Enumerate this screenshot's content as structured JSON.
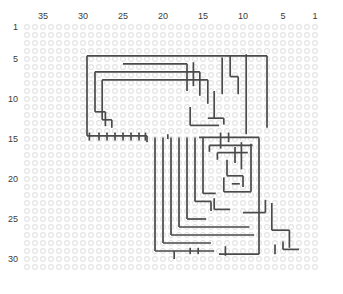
{
  "chart_data": {
    "type": "grid-pattern",
    "title": "",
    "xlabel": "",
    "ylabel": "",
    "grid": {
      "columns": 37,
      "rows": 31,
      "cell_size": 8,
      "origin_x": 27,
      "origin_y": 27,
      "direction_x": "right-to-left",
      "direction_y": "top-to-bottom",
      "dot_radius": 2.4,
      "dot_color": "#e2e2e2",
      "background": "#ffffff"
    },
    "axes": {
      "column_labels": [
        {
          "value": "35",
          "col": 35
        },
        {
          "value": "30",
          "col": 30
        },
        {
          "value": "25",
          "col": 25
        },
        {
          "value": "20",
          "col": 20
        },
        {
          "value": "15",
          "col": 15
        },
        {
          "value": "10",
          "col": 10
        },
        {
          "value": "5",
          "col": 5
        },
        {
          "value": "1",
          "col": 1
        }
      ],
      "row_labels": [
        {
          "value": "1",
          "row": 1
        },
        {
          "value": "5",
          "row": 5
        },
        {
          "value": "10",
          "row": 10
        },
        {
          "value": "15",
          "row": 15
        },
        {
          "value": "20",
          "row": 20
        },
        {
          "value": "25",
          "row": 25
        },
        {
          "value": "30",
          "row": 30
        }
      ]
    },
    "path_color": "#4a4a4a",
    "path_width": 1.7,
    "segments": [
      {
        "type": "h",
        "row": 4.6,
        "c1": 29.5,
        "c2": 7.0
      },
      {
        "type": "v",
        "col": 29.5,
        "r1": 4.6,
        "r2": 14.6
      },
      {
        "type": "h",
        "row": 14.6,
        "c1": 29.5,
        "c2": 22.0
      },
      {
        "type": "v",
        "col": 7.0,
        "r1": 4.6,
        "r2": 13.6
      },
      {
        "type": "h",
        "row": 5.6,
        "c1": 25.0,
        "c2": 17.0
      },
      {
        "type": "h",
        "row": 6.6,
        "c1": 28.5,
        "c2": 15.4
      },
      {
        "type": "v",
        "col": 28.5,
        "r1": 6.6,
        "r2": 11.6
      },
      {
        "type": "h",
        "row": 11.6,
        "c1": 28.5,
        "c2": 27.2
      },
      {
        "type": "v",
        "col": 27.2,
        "r1": 11.6,
        "r2": 13.4
      },
      {
        "type": "h",
        "row": 7.6,
        "c1": 27.6,
        "c2": 14.4
      },
      {
        "type": "v",
        "col": 27.6,
        "r1": 7.6,
        "r2": 12.6
      },
      {
        "type": "h",
        "row": 12.6,
        "c1": 27.6,
        "c2": 26.4
      },
      {
        "type": "v",
        "col": 26.4,
        "r1": 12.6,
        "r2": 13.6
      },
      {
        "type": "v",
        "col": 17.0,
        "r1": 5.6,
        "r2": 9.0
      },
      {
        "type": "v",
        "col": 15.4,
        "r1": 6.6,
        "r2": 9.6
      },
      {
        "type": "v",
        "col": 14.4,
        "r1": 7.6,
        "r2": 10.6
      },
      {
        "type": "v",
        "col": 16.2,
        "r1": 5.4,
        "r2": 8.4
      },
      {
        "type": "v",
        "col": 12.6,
        "r1": 4.8,
        "r2": 9.4
      },
      {
        "type": "v",
        "col": 11.6,
        "r1": 4.6,
        "r2": 7.2
      },
      {
        "type": "h",
        "row": 7.2,
        "c1": 11.6,
        "c2": 10.6
      },
      {
        "type": "v",
        "col": 10.6,
        "r1": 7.2,
        "r2": 9.4
      },
      {
        "type": "v",
        "col": 9.6,
        "r1": 4.4,
        "r2": 14.4
      },
      {
        "type": "v",
        "col": 13.6,
        "r1": 9.0,
        "r2": 12.4
      },
      {
        "type": "h",
        "row": 12.4,
        "c1": 14.4,
        "c2": 12.4
      },
      {
        "type": "v",
        "col": 12.4,
        "r1": 12.4,
        "r2": 13.2
      },
      {
        "type": "h",
        "row": 13.3,
        "c1": 16.6,
        "c2": 13.0
      },
      {
        "type": "v",
        "col": 16.6,
        "r1": 11.0,
        "r2": 13.3
      },
      {
        "type": "v",
        "col": 22.0,
        "r1": 14.6,
        "r2": 15.4
      },
      {
        "type": "v",
        "col": 21.0,
        "r1": 14.8,
        "r2": 29.0
      },
      {
        "type": "h",
        "row": 29.0,
        "c1": 21.0,
        "c2": 13.6
      },
      {
        "type": "v",
        "col": 20.0,
        "r1": 14.8,
        "r2": 28.0
      },
      {
        "type": "h",
        "row": 28.0,
        "c1": 20.0,
        "c2": 14.0
      },
      {
        "type": "v",
        "col": 19.0,
        "r1": 14.8,
        "r2": 27.0
      },
      {
        "type": "h",
        "row": 27.0,
        "c1": 19.0,
        "c2": 8.6
      },
      {
        "type": "v",
        "col": 18.0,
        "r1": 14.8,
        "r2": 26.0
      },
      {
        "type": "h",
        "row": 26.0,
        "c1": 18.0,
        "c2": 9.2
      },
      {
        "type": "v",
        "col": 17.0,
        "r1": 14.8,
        "r2": 25.0
      },
      {
        "type": "h",
        "row": 25.0,
        "c1": 17.0,
        "c2": 14.6
      },
      {
        "type": "v",
        "col": 16.0,
        "r1": 14.8,
        "r2": 22.8
      },
      {
        "type": "h",
        "row": 22.8,
        "c1": 16.0,
        "c2": 14.0
      },
      {
        "type": "v",
        "col": 14.0,
        "r1": 22.8,
        "r2": 24.0
      },
      {
        "type": "v",
        "col": 15.0,
        "r1": 14.8,
        "r2": 21.8
      },
      {
        "type": "h",
        "row": 21.8,
        "c1": 15.0,
        "c2": 13.4
      },
      {
        "type": "h",
        "row": 14.8,
        "c1": 15.5,
        "c2": 8.0
      },
      {
        "type": "v",
        "col": 8.0,
        "r1": 14.8,
        "r2": 29.4
      },
      {
        "type": "h",
        "row": 29.4,
        "c1": 8.0,
        "c2": 13.0
      },
      {
        "type": "h",
        "row": 15.8,
        "c1": 14.2,
        "c2": 8.8
      },
      {
        "type": "v",
        "col": 14.2,
        "r1": 15.8,
        "r2": 16.6
      },
      {
        "type": "h",
        "row": 16.7,
        "c1": 13.2,
        "c2": 9.4
      },
      {
        "type": "v",
        "col": 13.2,
        "r1": 16.7,
        "r2": 17.6
      },
      {
        "type": "v",
        "col": 9.0,
        "r1": 15.6,
        "r2": 21.6
      },
      {
        "type": "h",
        "row": 21.6,
        "c1": 9.0,
        "c2": 12.4
      },
      {
        "type": "v",
        "col": 12.4,
        "r1": 19.8,
        "r2": 21.6
      },
      {
        "type": "h",
        "row": 19.6,
        "c1": 12.0,
        "c2": 10.0
      },
      {
        "type": "v",
        "col": 12.0,
        "r1": 17.6,
        "r2": 19.6
      },
      {
        "type": "v",
        "col": 10.0,
        "r1": 19.6,
        "r2": 21.0
      },
      {
        "type": "h",
        "row": 20.6,
        "c1": 11.4,
        "c2": 10.4
      },
      {
        "type": "v",
        "col": 11.0,
        "r1": 16.0,
        "r2": 18.0
      },
      {
        "type": "v",
        "col": 10.2,
        "r1": 15.4,
        "r2": 18.8
      },
      {
        "type": "v",
        "col": 12.8,
        "r1": 14.2,
        "r2": 16.2
      },
      {
        "type": "v",
        "col": 11.8,
        "r1": 14.2,
        "r2": 15.4
      },
      {
        "type": "h",
        "row": 23.8,
        "c1": 13.6,
        "c2": 11.6
      },
      {
        "type": "v",
        "col": 13.6,
        "r1": 22.4,
        "r2": 23.8
      },
      {
        "type": "v",
        "col": 19.4,
        "r1": 14.4,
        "r2": 15.0
      },
      {
        "type": "v",
        "col": 12.2,
        "r1": 28.4,
        "r2": 29.6
      },
      {
        "type": "v",
        "col": 25.0,
        "r1": 14.2,
        "r2": 15.2
      },
      {
        "type": "v",
        "col": 24.0,
        "r1": 14.2,
        "r2": 15.2
      },
      {
        "type": "v",
        "col": 23.0,
        "r1": 14.2,
        "r2": 15.2
      },
      {
        "type": "v",
        "col": 22.2,
        "r1": 14.2,
        "r2": 15.2
      },
      {
        "type": "v",
        "col": 26.0,
        "r1": 14.2,
        "r2": 15.2
      },
      {
        "type": "v",
        "col": 27.0,
        "r1": 14.2,
        "r2": 15.2
      },
      {
        "type": "v",
        "col": 28.0,
        "r1": 14.2,
        "r2": 15.2
      },
      {
        "type": "v",
        "col": 29.2,
        "r1": 14.2,
        "r2": 15.2
      },
      {
        "type": "v",
        "col": 18.6,
        "r1": 29.0,
        "r2": 30.0
      },
      {
        "type": "v",
        "col": 16.6,
        "r1": 28.6,
        "r2": 29.4
      },
      {
        "type": "v",
        "col": 15.6,
        "r1": 28.6,
        "r2": 29.4
      },
      {
        "type": "h",
        "row": 24.2,
        "c1": 10.0,
        "c2": 7.2
      },
      {
        "type": "v",
        "col": 7.2,
        "r1": 22.6,
        "r2": 24.2
      },
      {
        "type": "v",
        "col": 6.4,
        "r1": 23.0,
        "r2": 26.4
      },
      {
        "type": "h",
        "row": 26.4,
        "c1": 6.4,
        "c2": 4.2
      },
      {
        "type": "v",
        "col": 4.2,
        "r1": 26.4,
        "r2": 28.6
      },
      {
        "type": "h",
        "row": 28.8,
        "c1": 5.0,
        "c2": 3.0
      },
      {
        "type": "v",
        "col": 5.0,
        "r1": 27.8,
        "r2": 28.8
      },
      {
        "type": "v",
        "col": 6.0,
        "r1": 28.2,
        "r2": 29.4
      }
    ]
  }
}
